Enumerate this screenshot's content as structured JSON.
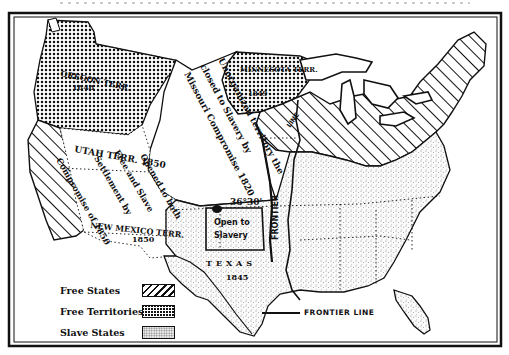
{
  "map": {
    "title": "Missouri Compromise and Compromise of 1850",
    "region_labels": {
      "oregon": "OREGON TERR.",
      "oregon_year": "1848",
      "minnesota": "MINNESOTA TERR.",
      "minnesota_year": "1849",
      "unorganized_line1": "Unorganized territory the",
      "unorganized_line2": "closed to Slavery by",
      "unorganized_line3": "Missouri Compromise 1820",
      "latitude": "36°30'",
      "utah": "UTAH TERR. 1850",
      "compromise_line1": "Compromise of 1850",
      "compromise_line2": "Settlement by",
      "compromise_line3": "Free and Slave",
      "compromise_line4": "Opened to both",
      "new_mexico": "NEW MEXICO TERR.",
      "new_mexico_year": "1850",
      "open_slavery_line1": "Open to",
      "open_slavery_line2": "Slavery",
      "texas": "TEXAS",
      "texas_year": "1845",
      "frontier_vertical": "FRONTIER",
      "line_label": "LINE"
    },
    "colors": {
      "ink": "#111111",
      "paper": "#ffffff",
      "stipple": "#8a8a8a"
    }
  },
  "legend": {
    "items": [
      {
        "label": "Free States",
        "pattern": "diagonal-hatch"
      },
      {
        "label": "Free Territories",
        "pattern": "dark-dotted"
      },
      {
        "label": "Slave States",
        "pattern": "light-stipple"
      }
    ],
    "frontier": "FRONTIER LINE"
  }
}
